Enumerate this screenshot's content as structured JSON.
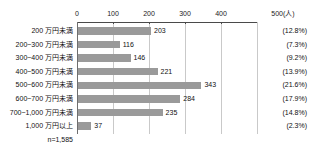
{
  "chart_data": {
    "type": "bar",
    "orientation": "horizontal",
    "title": "",
    "subtitle": "",
    "xlabel": "",
    "ylabel": "",
    "unit_label": "500(人)",
    "unit_suffix": "(人)",
    "xlim": [
      0,
      500
    ],
    "grid": true,
    "legend": "none",
    "categories": [
      "200 万円未満",
      "200~300 万円未満",
      "300~400 万円未満",
      "400~500 万円未満",
      "500~600 万円未満",
      "600~700 万円未満",
      "700~1,000 万円未満",
      "1,000 万円以上"
    ],
    "values": [
      203,
      116,
      146,
      221,
      343,
      284,
      235,
      37
    ],
    "value_labels": [
      "203",
      "116",
      "146",
      "221",
      "343",
      "284",
      "235",
      "37"
    ],
    "percent_labels": [
      "(12.8%)",
      "(7.3%)",
      "(9.2%)",
      "(13.9%)",
      "(21.6%)",
      "(17.9%)",
      "(14.8%)",
      "(2.3%)"
    ],
    "percent_values": [
      12.8,
      7.3,
      9.2,
      13.9,
      21.6,
      17.9,
      14.8,
      2.3
    ],
    "tick_values": [
      0,
      100,
      200,
      300,
      400,
      500
    ],
    "tick_labels": [
      "0",
      "100",
      "200",
      "300",
      "400",
      "500(人)"
    ],
    "sample_note": "n=1,585",
    "sample_size": 1585,
    "bar_color": "#9a9a9a",
    "axis_color": "#4a4a4a",
    "grid_color": "#c9c9c9",
    "text_color": "#111111",
    "background_color": "#ffffff"
  }
}
